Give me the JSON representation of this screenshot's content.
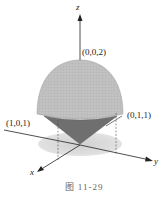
{
  "figure": {
    "caption": "图  11-29",
    "axes": {
      "x": "x",
      "y": "y",
      "z": "z"
    },
    "points": {
      "top": "(0,0,2)",
      "left": "(1,0,1)",
      "right": "(0,1,1)"
    },
    "colors": {
      "sphere": "#bdbdbd",
      "cone": "#6e6e6e",
      "shadow": "#d9d9d9",
      "axis": "#222222"
    }
  }
}
